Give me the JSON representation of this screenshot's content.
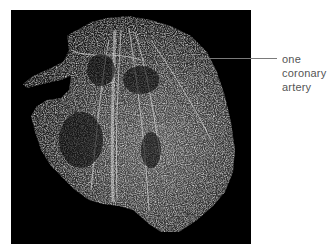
{
  "figure": {
    "photo_description": "Vascular corrosion cast of a heart on black background",
    "background_color": "#000000",
    "leader_line_color": "#7a7a7a",
    "label": {
      "lines": [
        "one",
        "coronary",
        "artery"
      ],
      "color": "#555555"
    }
  }
}
